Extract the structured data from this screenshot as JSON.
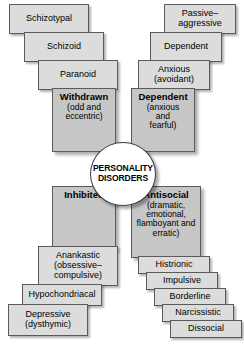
{
  "diagram": {
    "title": "Personality Disorders",
    "center": {
      "line1": "PERSONALITY",
      "line2": "DISORDERS"
    },
    "colors": {
      "leaf_fill": "#dcdcdc",
      "cluster_fill": "#c6c6c6",
      "circle_fill": "#ffffff",
      "border": "#5a5a5a",
      "text": "#000000"
    },
    "clusters": [
      {
        "id": "withdrawn",
        "head": "Withdrawn",
        "sub": "(odd and\neccentric)",
        "quadrant": "top-left",
        "members": [
          "Schizotypal",
          "Schizoid",
          "Paranoid"
        ]
      },
      {
        "id": "dependent",
        "head": "Dependent",
        "sub": "(anxious\nand\nfearful)",
        "quadrant": "top-right",
        "members": [
          "Passive–\naggressive",
          "Dependent",
          "Anxious\n(avoidant)"
        ]
      },
      {
        "id": "inhibited",
        "head": "Inhibited",
        "sub": "",
        "quadrant": "bottom-left",
        "members": [
          "Anankastic\n(obsessive–\ncompulsive)",
          "Hypochondriacal",
          "Depressive\n(dysthymic)"
        ]
      },
      {
        "id": "antisocial",
        "head": "Antisocial",
        "sub": "(dramatic,\nemotional,\nflamboyant and\nerratic)",
        "quadrant": "bottom-right",
        "members": [
          "Histrionic",
          "Impulsive",
          "Borderline",
          "Narcissistic",
          "Dissocial"
        ]
      }
    ],
    "boxes": {
      "tl1": "Schizotypal",
      "tl2": "Schizoid",
      "tl3": "Paranoid",
      "tr1": "Passive–\naggressive",
      "tr2": "Dependent",
      "tr3": "Anxious\n(avoidant)",
      "bl1": "Anankastic\n(obsessive–\ncompulsive)",
      "bl2": "Hypochondriacal",
      "bl3": "Depressive\n(dysthymic)",
      "br1": "Histrionic",
      "br2": "Impulsive",
      "br3": "Borderline",
      "br4": "Narcissistic",
      "br5": "Dissocial"
    },
    "cluster_labels": {
      "withdrawn_head": "Withdrawn",
      "withdrawn_sub": "(odd and\neccentric)",
      "dependent_head": "Dependent",
      "dependent_sub": "(anxious\nand\nfearful)",
      "inhibited_head": "Inhibited",
      "inhibited_sub": "",
      "antisocial_head": "Antisocial",
      "antisocial_sub": "(dramatic,\nemotional,\nflamboyant and\nerratic)"
    }
  }
}
